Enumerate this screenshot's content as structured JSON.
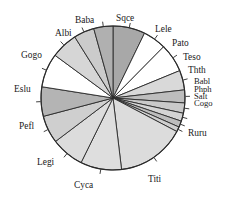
{
  "chart_data": {
    "type": "pie",
    "title": "",
    "xlabel": "",
    "ylabel": "",
    "legend_position": "none",
    "grid": false,
    "labels_outside": true,
    "start_angle_deg": 90,
    "direction": "clockwise",
    "categories": [
      "Sqce",
      "Lele",
      "Pato",
      "Teso",
      "Thth",
      "Babl",
      "Phph",
      "Salt",
      "Cogo",
      "Ruru",
      "Titi",
      "Cyca",
      "Legi",
      "Pefl",
      "Eslu",
      "Gogo",
      "Albi",
      "Baba"
    ],
    "values": [
      7.2,
      5.2,
      6.4,
      4.4,
      2.9,
      2.3,
      1.8,
      1.4,
      1.1,
      15.4,
      9.2,
      7.4,
      6.2,
      6.6,
      7.6,
      6.0,
      4.6,
      4.3
    ],
    "units": "percent",
    "slice_colors": [
      "#a8a8a8",
      "#ffffff",
      "#ffffff",
      "#d9d9d9",
      "#bdbdbd",
      "#c9c9c9",
      "#d4d4d4",
      "#bdbdbd",
      "#cfcfcf",
      "#dcdcdc",
      "#dedede",
      "#dcdcdc",
      "#cfcfcf",
      "#b4b4b4",
      "#ffffff",
      "#d6d6d6",
      "#cbcbcb",
      "#b0b0b0"
    ],
    "outline_color": "#2a2a2a",
    "background_color": "#ffffff"
  },
  "labels": {
    "sqce": "Sqce",
    "lele": "Lele",
    "pato": "Pato",
    "teso": "Teso",
    "thth": "Thth",
    "babl": "Babl",
    "phph": "Phph",
    "salt": "Salt",
    "cogo": "Cogo",
    "ruru": "Ruru",
    "titi": "Titi",
    "cyca": "Cyca",
    "legi": "Legi",
    "pefl": "Pefl",
    "eslu": "Eslu",
    "gogo": "Gogo",
    "albi": "Albi",
    "baba": "Baba"
  }
}
